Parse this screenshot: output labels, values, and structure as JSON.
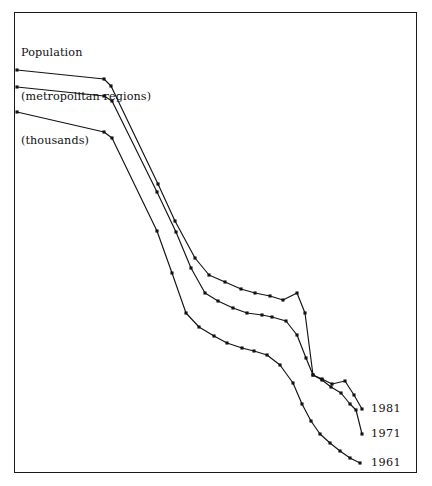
{
  "figure": {
    "title_lines": [
      "Population",
      "(metropolitan regions)",
      "(thousands)"
    ],
    "frame_color": "#1a1a1a",
    "background": "#ffffff",
    "line_color": "#121212"
  },
  "labels": {
    "s1981": "1981",
    "s1971": "1971",
    "s1961": "1961"
  },
  "chart_data": {
    "type": "line",
    "title": "Population (metropolitan regions) (thousands)",
    "xlabel": "",
    "ylabel": "Population (metropolitan regions) (thousands)",
    "grid": false,
    "axes_visible": false,
    "legend_position": "right-end-of-line",
    "note": "Rank-size style declining curves; three census years plotted as descending step profiles with square point markers. Values are read in pixel-space of the original figure (x left-to-right = rank order, y downward = decreasing population).",
    "series": [
      {
        "name": "1981",
        "label_at": [
          371,
          409
        ],
        "points": [
          [
            17,
            70
          ],
          [
            104,
            79
          ],
          [
            111,
            86
          ],
          [
            158,
            184
          ],
          [
            175,
            221
          ],
          [
            195,
            258
          ],
          [
            209,
            275
          ],
          [
            225,
            282
          ],
          [
            241,
            289
          ],
          [
            255,
            293
          ],
          [
            270,
            296
          ],
          [
            283,
            300
          ],
          [
            297,
            293
          ],
          [
            305,
            313
          ],
          [
            313,
            375
          ],
          [
            322,
            379
          ],
          [
            332,
            384
          ],
          [
            345,
            381
          ],
          [
            354,
            395
          ],
          [
            362,
            409
          ]
        ]
      },
      {
        "name": "1971",
        "label_at": [
          371,
          434
        ],
        "points": [
          [
            17,
            87
          ],
          [
            104,
            96
          ],
          [
            112,
            101
          ],
          [
            157,
            192
          ],
          [
            176,
            232
          ],
          [
            191,
            268
          ],
          [
            205,
            293
          ],
          [
            218,
            301
          ],
          [
            233,
            308
          ],
          [
            247,
            313
          ],
          [
            262,
            315
          ],
          [
            272,
            317
          ],
          [
            286,
            321
          ],
          [
            297,
            335
          ],
          [
            306,
            358
          ],
          [
            313,
            375
          ],
          [
            322,
            380
          ],
          [
            331,
            387
          ],
          [
            341,
            393
          ],
          [
            350,
            404
          ],
          [
            356,
            410
          ],
          [
            362,
            434
          ]
        ]
      },
      {
        "name": "1961",
        "label_at": [
          371,
          463
        ],
        "points": [
          [
            17,
            112
          ],
          [
            104,
            132
          ],
          [
            112,
            138
          ],
          [
            157,
            231
          ],
          [
            172,
            273
          ],
          [
            186,
            313
          ],
          [
            199,
            327
          ],
          [
            214,
            336
          ],
          [
            227,
            343
          ],
          [
            242,
            348
          ],
          [
            254,
            351
          ],
          [
            267,
            355
          ],
          [
            280,
            365
          ],
          [
            293,
            383
          ],
          [
            302,
            404
          ],
          [
            311,
            421
          ],
          [
            320,
            434
          ],
          [
            330,
            443
          ],
          [
            340,
            451
          ],
          [
            350,
            458
          ],
          [
            360,
            463
          ]
        ]
      }
    ]
  }
}
